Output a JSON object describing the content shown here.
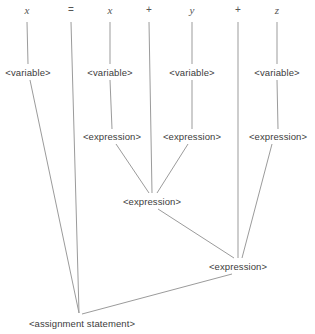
{
  "figure": {
    "name": "parse-tree-assignment-statement",
    "width": 315,
    "height": 334,
    "background_color": "#ffffff",
    "edge_color": "#9b9b9b",
    "label_color": "#3c3c3c",
    "token_color": "#555555"
  },
  "tokens": [
    {
      "text": "x",
      "kind": "identifier",
      "x": 27,
      "y": 10
    },
    {
      "text": "=",
      "kind": "operator",
      "x": 71,
      "y": 10
    },
    {
      "text": "x",
      "kind": "identifier",
      "x": 110,
      "y": 10
    },
    {
      "text": "+",
      "kind": "operator",
      "x": 149,
      "y": 10
    },
    {
      "text": "y",
      "kind": "identifier",
      "x": 192,
      "y": 10
    },
    {
      "text": "+",
      "kind": "operator",
      "x": 238,
      "y": 10
    },
    {
      "text": "z",
      "kind": "identifier",
      "x": 277,
      "y": 10
    }
  ],
  "nodes": [
    {
      "text": "<variable>",
      "x": 28,
      "y": 72
    },
    {
      "text": "<variable>",
      "x": 110,
      "y": 72
    },
    {
      "text": "<variable>",
      "x": 192,
      "y": 72
    },
    {
      "text": "<variable>",
      "x": 277,
      "y": 72
    },
    {
      "text": "<expression>",
      "x": 112,
      "y": 136
    },
    {
      "text": "<expression>",
      "x": 192,
      "y": 136
    },
    {
      "text": "<expression>",
      "x": 278,
      "y": 136
    },
    {
      "text": "<expression>",
      "x": 152,
      "y": 201
    },
    {
      "text": "<expression>",
      "x": 238,
      "y": 266
    },
    {
      "text": "<assignment statement>",
      "x": 82,
      "y": 323
    }
  ],
  "edges": [
    {
      "from": "token-x-1",
      "to": "variable-1",
      "x1": 27,
      "y1": 22,
      "x2": 28,
      "y2": 64
    },
    {
      "from": "token-x-2",
      "to": "variable-2",
      "x1": 110,
      "y1": 22,
      "x2": 110,
      "y2": 64
    },
    {
      "from": "token-y",
      "to": "variable-3",
      "x1": 192,
      "y1": 22,
      "x2": 192,
      "y2": 64
    },
    {
      "from": "token-z",
      "to": "variable-4",
      "x1": 277,
      "y1": 22,
      "x2": 277,
      "y2": 64
    },
    {
      "from": "token-equals",
      "to": "assignment",
      "x1": 71,
      "y1": 22,
      "x2": 79,
      "y2": 313
    },
    {
      "from": "token-plus-1",
      "to": "expression-4",
      "x1": 149,
      "y1": 22,
      "x2": 152,
      "y2": 193
    },
    {
      "from": "token-plus-2",
      "to": "expression-5",
      "x1": 238,
      "y1": 22,
      "x2": 238,
      "y2": 258
    },
    {
      "from": "variable-1",
      "to": "assignment",
      "x1": 30,
      "y1": 80,
      "x2": 79,
      "y2": 313
    },
    {
      "from": "variable-2",
      "to": "expression-1",
      "x1": 110,
      "y1": 80,
      "x2": 112,
      "y2": 129
    },
    {
      "from": "variable-3",
      "to": "expression-2",
      "x1": 192,
      "y1": 80,
      "x2": 192,
      "y2": 129
    },
    {
      "from": "variable-4",
      "to": "expression-3",
      "x1": 277,
      "y1": 80,
      "x2": 278,
      "y2": 129
    },
    {
      "from": "expression-1",
      "to": "expression-4",
      "x1": 116,
      "y1": 144,
      "x2": 149,
      "y2": 193
    },
    {
      "from": "expression-2",
      "to": "expression-4",
      "x1": 188,
      "y1": 144,
      "x2": 157,
      "y2": 193
    },
    {
      "from": "expression-3",
      "to": "expression-5",
      "x1": 272,
      "y1": 144,
      "x2": 242,
      "y2": 258
    },
    {
      "from": "expression-4",
      "to": "expression-5",
      "x1": 158,
      "y1": 209,
      "x2": 234,
      "y2": 258
    },
    {
      "from": "expression-5",
      "to": "assignment",
      "x1": 232,
      "y1": 274,
      "x2": 82,
      "y2": 314
    }
  ]
}
